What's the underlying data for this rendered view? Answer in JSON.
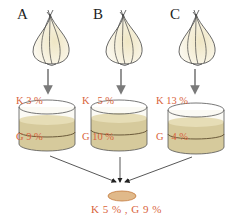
{
  "samples": [
    {
      "label": "A",
      "K": "K 3 %",
      "G": "G 9 %"
    },
    {
      "label": "B",
      "K": "K   5 %",
      "G": "G 10 %"
    },
    {
      "label": "C",
      "K": "K 13 %",
      "G": "G   4 %"
    }
  ],
  "result": {
    "text": "K 5 % , G 9 %"
  },
  "colors": {
    "label_text": "#d9643c",
    "medium": "#d6ca9c",
    "arrow": "#7a7a7a",
    "result_disc": "#e0b98a"
  }
}
